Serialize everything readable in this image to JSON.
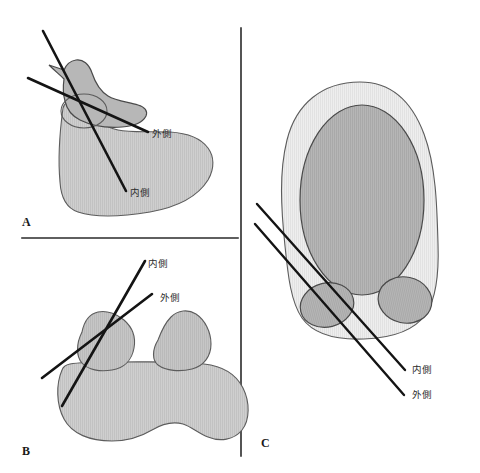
{
  "figure": {
    "title": "",
    "background_color": "#ffffff",
    "width": 480,
    "height": 473,
    "panel_count": 3
  },
  "labels": {
    "lateral": "外側",
    "medial": "内側"
  },
  "colors": {
    "line": "#141414",
    "divider": "#2a2a2a",
    "outline": "#5c5c5c",
    "fill_light": "#ececec",
    "fill_mid": "#c9c9c9",
    "fill_dark": "#b0b0b0",
    "text": "#2b2b2b",
    "panel_letter": "#1a1a1a"
  },
  "panels": [
    {
      "id": "A",
      "letter": "A",
      "letter_pos": {
        "x": 22,
        "y": 226
      },
      "view": "lateral-sagittal-bone-section",
      "annotations": [
        {
          "name": "lateral",
          "text": "外側",
          "text_pos": {
            "x": 152,
            "y": 137
          },
          "line": {
            "x1": 28,
            "y1": 78,
            "x2": 148,
            "y2": 132
          }
        },
        {
          "name": "medial",
          "text": "内側",
          "text_pos": {
            "x": 130,
            "y": 196
          },
          "line": {
            "x1": 43,
            "y1": 31,
            "x2": 126,
            "y2": 191
          }
        }
      ]
    },
    {
      "id": "B",
      "letter": "B",
      "letter_pos": {
        "x": 22,
        "y": 455
      },
      "view": "posterior-vertebra-section",
      "annotations": [
        {
          "name": "medial",
          "text": "内側",
          "text_pos": {
            "x": 148,
            "y": 267
          },
          "line": {
            "x1": 145,
            "y1": 261,
            "x2": 62,
            "y2": 406
          }
        },
        {
          "name": "lateral",
          "text": "外側",
          "text_pos": {
            "x": 160,
            "y": 301
          },
          "line": {
            "x1": 152,
            "y1": 294,
            "x2": 42,
            "y2": 378
          }
        }
      ]
    },
    {
      "id": "C",
      "letter": "C",
      "letter_pos": {
        "x": 261,
        "y": 447
      },
      "view": "axial-cross-section",
      "annotations": [
        {
          "name": "medial",
          "text": "内側",
          "text_pos": {
            "x": 412,
            "y": 373
          },
          "line": {
            "x1": 257,
            "y1": 204,
            "x2": 405,
            "y2": 370
          }
        },
        {
          "name": "lateral",
          "text": "外側",
          "text_pos": {
            "x": 412,
            "y": 398
          },
          "line": {
            "x1": 255,
            "y1": 224,
            "x2": 404,
            "y2": 395
          }
        }
      ]
    }
  ],
  "dividers": [
    {
      "name": "horizontal-divider",
      "x1": 22,
      "y1": 238,
      "x2": 238,
      "y2": 238
    },
    {
      "name": "vertical-divider",
      "x1": 241,
      "y1": 28,
      "x2": 241,
      "y2": 456
    }
  ]
}
